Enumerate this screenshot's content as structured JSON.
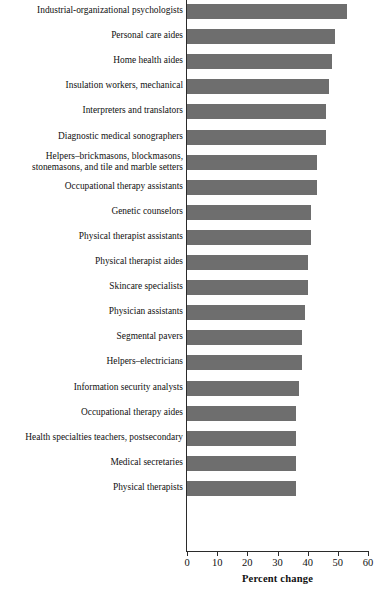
{
  "chart_data": {
    "type": "bar",
    "orientation": "horizontal",
    "title": "",
    "xlabel": "Percent change",
    "ylabel": "",
    "xlim": [
      0,
      60
    ],
    "xticks": [
      0,
      10,
      20,
      30,
      40,
      50,
      60
    ],
    "xtick_labels": [
      "0",
      "10",
      "20",
      "30",
      "40",
      "50",
      "60"
    ],
    "grid": false,
    "legend": "none",
    "bar_color": "#6e6e6e",
    "axis_color": "#2b2b2b",
    "categories": [
      "Industrial-organizational psychologists",
      "Personal care aides",
      "Home health aides",
      "Insulation workers, mechanical",
      "Interpreters and translators",
      "Diagnostic medical sonographers",
      "Helpers–brickmasons, blockmasons,\nstonemasons, and tile and marble setters",
      "Occupational therapy assistants",
      "Genetic counselors",
      "Physical therapist assistants",
      "Physical therapist aides",
      "Skincare specialists",
      "Physician assistants",
      "Segmental pavers",
      "Helpers–electricians",
      "Information security analysts",
      "Occupational therapy aides",
      "Health specialties teachers, postsecondary",
      "Medical secretaries",
      "Physical therapists"
    ],
    "values": [
      53,
      49,
      48,
      47,
      46,
      46,
      43,
      43,
      41,
      41,
      40,
      40,
      39,
      38,
      38,
      37,
      36,
      36,
      36,
      36
    ]
  }
}
